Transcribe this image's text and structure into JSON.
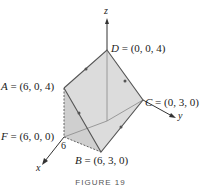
{
  "figure": {
    "caption": "FIGURE 19",
    "axes": {
      "x": "x",
      "y": "y",
      "z": "z"
    },
    "tick_label": "6",
    "points": {
      "D": {
        "name": "D",
        "coords": "= (0, 0, 4)"
      },
      "A": {
        "name": "A",
        "coords": "= (6, 0, 4)"
      },
      "C": {
        "name": "C",
        "coords": "= (0, 3, 0)"
      },
      "F": {
        "name": "F",
        "coords": "= (6, 0, 0)"
      },
      "B": {
        "name": "B",
        "coords": "= (6, 3, 0)"
      }
    },
    "colors": {
      "face": "#d9d9d9",
      "edge": "#555555",
      "axis": "#333333"
    }
  }
}
